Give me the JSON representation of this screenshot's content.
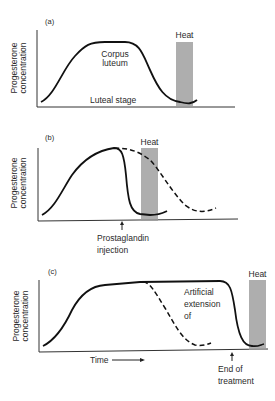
{
  "panels": [
    {
      "id": "a",
      "label": "(a)",
      "y_axis_label_line1": "Progesterone",
      "y_axis_label_line2": "concentration",
      "heat_label": "Heat",
      "annotation_line1": "Corpus",
      "annotation_line2": "luteum",
      "x_annotation": "Luteal stage"
    },
    {
      "id": "b",
      "label": "(b)",
      "y_axis_label_line1": "Progesterone",
      "y_axis_label_line2": "concentration",
      "heat_label": "Heat",
      "arrow_label_line1": "Prostaglandin",
      "arrow_label_line2": "injection"
    },
    {
      "id": "c",
      "label": "(c)",
      "y_axis_label_line1": "Progesterone",
      "y_axis_label_line2": "concentration",
      "heat_label": "Heat",
      "annotation_line1": "Artificial",
      "annotation_line2": "extension",
      "annotation_line3": "of",
      "x_axis_label": "Time",
      "arrow_label_line1": "End of",
      "arrow_label_line2": "treatment"
    }
  ],
  "colors": {
    "heat_bar": "#9a9a9a",
    "curve": "#111111"
  }
}
